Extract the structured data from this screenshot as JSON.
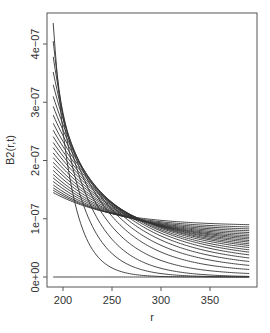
{
  "chart_data": {
    "type": "line",
    "title": "",
    "xlabel": "r",
    "ylabel": "B2(r,t)",
    "xlim": [
      186,
      396
    ],
    "ylim": [
      -1.7e-08,
      4.55e-07
    ],
    "x_ticks": [
      200,
      250,
      300,
      350
    ],
    "x_tick_labels": [
      "200",
      "250",
      "300",
      "350"
    ],
    "y_ticks": [
      0,
      1e-07,
      2e-07,
      3e-07,
      4e-07
    ],
    "y_tick_labels": [
      "0e+00",
      "1e−07",
      "2e−07",
      "3e−07",
      "4e−07"
    ],
    "grid": false,
    "legend": null,
    "line_color": "#333333",
    "x_range": [
      190,
      390
    ],
    "series_model": "B(r) = c + (a - c) * exp(-(r - 190) / L)",
    "series": [
      {
        "name": "t0",
        "a": 0.0,
        "c": 0.0,
        "L": 1000
      },
      {
        "name": "t1",
        "a": 4.36e-07,
        "c": 0.0,
        "L": 18
      },
      {
        "name": "t2",
        "a": 4.05e-07,
        "c": 0.0,
        "L": 26
      },
      {
        "name": "t3",
        "a": 3.78e-07,
        "c": 0.0,
        "L": 34
      },
      {
        "name": "t4",
        "a": 3.52e-07,
        "c": 3e-09,
        "L": 42
      },
      {
        "name": "t5",
        "a": 3.3e-07,
        "c": 7e-09,
        "L": 50
      },
      {
        "name": "t6",
        "a": 3.1e-07,
        "c": 1.1e-08,
        "L": 57
      },
      {
        "name": "t7",
        "a": 2.93e-07,
        "c": 1.5e-08,
        "L": 63
      },
      {
        "name": "t8",
        "a": 2.78e-07,
        "c": 1.9e-08,
        "L": 68
      },
      {
        "name": "t9",
        "a": 2.64e-07,
        "c": 2.3e-08,
        "L": 72
      },
      {
        "name": "t10",
        "a": 2.52e-07,
        "c": 2.7e-08,
        "L": 75
      },
      {
        "name": "t11",
        "a": 2.41e-07,
        "c": 3.1e-08,
        "L": 77
      },
      {
        "name": "t12",
        "a": 2.31e-07,
        "c": 3.5e-08,
        "L": 79
      },
      {
        "name": "t13",
        "a": 2.22e-07,
        "c": 3.9e-08,
        "L": 80
      },
      {
        "name": "t14",
        "a": 2.13e-07,
        "c": 4.3e-08,
        "L": 80
      },
      {
        "name": "t15",
        "a": 2.05e-07,
        "c": 4.7e-08,
        "L": 80
      },
      {
        "name": "t16",
        "a": 1.97e-07,
        "c": 5.1e-08,
        "L": 79
      },
      {
        "name": "t17",
        "a": 1.9e-07,
        "c": 5.5e-08,
        "L": 78
      },
      {
        "name": "t18",
        "a": 1.83e-07,
        "c": 5.9e-08,
        "L": 76
      },
      {
        "name": "t19",
        "a": 1.76e-07,
        "c": 6.3e-08,
        "L": 74
      },
      {
        "name": "t20",
        "a": 1.7e-07,
        "c": 6.7e-08,
        "L": 72
      },
      {
        "name": "t21",
        "a": 1.64e-07,
        "c": 7.1e-08,
        "L": 70
      },
      {
        "name": "t22",
        "a": 1.58e-07,
        "c": 7.5e-08,
        "L": 68
      },
      {
        "name": "t23",
        "a": 1.53e-07,
        "c": 7.9e-08,
        "L": 66
      },
      {
        "name": "t24",
        "a": 1.49e-07,
        "c": 8.3e-08,
        "L": 64
      },
      {
        "name": "t25",
        "a": 1.45e-07,
        "c": 8.75e-08,
        "L": 62
      }
    ]
  },
  "plot": {
    "box": {
      "left": 47,
      "top": 13,
      "right": 257,
      "bottom": 287
    },
    "x_scale": {
      "r0": 200,
      "px0": 63,
      "r1": 350,
      "px1": 210
    },
    "y_scale": {
      "v0": 0,
      "px0": 277,
      "v1": 4e-07,
      "px1": 44
    }
  }
}
